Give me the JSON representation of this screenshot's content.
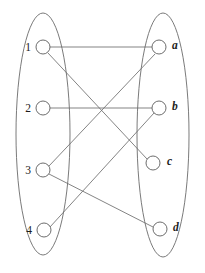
{
  "diagram": {
    "type": "bipartite-graph",
    "colors": {
      "background": "#ffffff",
      "stroke": "#6b6b6b",
      "edge": "#6e6e6e",
      "vertex_fill": "#ffffff",
      "vertex_stroke": "#5c5c5c",
      "label": "#1c1c1c"
    },
    "sets": [
      {
        "name": "left-set",
        "ellipse": {
          "cx": 43,
          "cy": 134,
          "rx": 27,
          "ry": 121
        },
        "vertices": [
          {
            "id": "1",
            "label": "1",
            "cx": 43,
            "cy": 47,
            "r": 7,
            "label_x": 31,
            "label_y": 47
          },
          {
            "id": "2",
            "label": "2",
            "cx": 43,
            "cy": 108,
            "r": 7,
            "label_x": 31,
            "label_y": 108
          },
          {
            "id": "3",
            "label": "3",
            "cx": 43,
            "cy": 170,
            "r": 7,
            "label_x": 31,
            "label_y": 170
          },
          {
            "id": "4",
            "label": "4",
            "cx": 44,
            "cy": 230,
            "r": 7,
            "label_x": 32,
            "label_y": 230
          }
        ]
      },
      {
        "name": "right-set",
        "ellipse": {
          "cx": 163,
          "cy": 135,
          "rx": 26,
          "ry": 122
        },
        "vertices": [
          {
            "id": "a",
            "label": "a",
            "cx": 159,
            "cy": 47,
            "r": 7,
            "label_x": 172,
            "label_y": 45
          },
          {
            "id": "b",
            "label": "b",
            "cx": 159,
            "cy": 108,
            "r": 7,
            "label_x": 172,
            "label_y": 106
          },
          {
            "id": "c",
            "label": "c",
            "cx": 153,
            "cy": 163,
            "r": 7,
            "label_x": 167,
            "label_y": 161
          },
          {
            "id": "d",
            "label": "d",
            "cx": 160,
            "cy": 229,
            "r": 7,
            "label_x": 173,
            "label_y": 227
          }
        ]
      }
    ],
    "edges": [
      {
        "name": "edge-1-a",
        "from": "1",
        "to": "a",
        "x1": 50,
        "y1": 47,
        "x2": 152,
        "y2": 47
      },
      {
        "name": "edge-1-c",
        "from": "1",
        "to": "c",
        "x1": 48,
        "y1": 53,
        "x2": 147,
        "y2": 159
      },
      {
        "name": "edge-2-b",
        "from": "2",
        "to": "b",
        "x1": 50,
        "y1": 108,
        "x2": 152,
        "y2": 108
      },
      {
        "name": "edge-3-a",
        "from": "3",
        "to": "a",
        "x1": 49,
        "y1": 166,
        "x2": 155,
        "y2": 54
      },
      {
        "name": "edge-3-d",
        "from": "3",
        "to": "d",
        "x1": 49,
        "y1": 174,
        "x2": 153,
        "y2": 227
      },
      {
        "name": "edge-4-b",
        "from": "4",
        "to": "b",
        "x1": 50,
        "y1": 227,
        "x2": 154,
        "y2": 113
      }
    ]
  }
}
